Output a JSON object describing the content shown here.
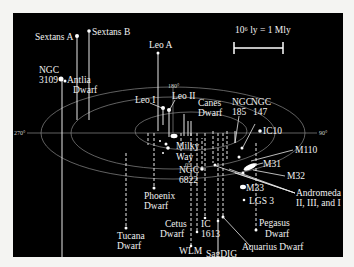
{
  "figure": {
    "scale_bar": {
      "label": "10⁶ ly = 1 Mly"
    },
    "axis_ticks": {
      "top": "180°",
      "left": "270°",
      "right": "90°",
      "bottom": "0°"
    }
  },
  "galaxies": {
    "sextans_a": "Sextans A",
    "sextans_b": "Sextans B",
    "ngc3109_l1": "NGC",
    "ngc3109_l2": "3109",
    "antlia_l1": "Antlia",
    "antlia_l2": "Dwarf",
    "leo_a": "Leo A",
    "leo_i": "Leo I",
    "leo_ii": "Leo II",
    "canes_l1": "Canes",
    "canes_l2": "Dwarf",
    "milky_l1": "Milky",
    "milky_l2": "Way",
    "ngc6822_l1": "NGC",
    "ngc6822_l2": "6822",
    "phoenix_l1": "Phoenix",
    "phoenix_l2": "Dwarf",
    "tucana_l1": "Tucana",
    "tucana_l2": "Dwarf",
    "ngc185_l1": "NGC",
    "ngc185_l2": "185",
    "ngc147_l1": "NGC",
    "ngc147_l2": "147",
    "ic10": "IC10",
    "m110": "M110",
    "m31": "M31",
    "m32": "M32",
    "m33": "M33",
    "andromeda_l1": "Andromeda",
    "andromeda_l2": "II, III, and I",
    "lgs3": "LGS 3",
    "pegasus_l1": "Pegasus",
    "pegasus_l2": "Dwarf",
    "aquarius": "Aquarius Dwarf",
    "cetus_l1": "Cetus",
    "cetus_l2": "Dwarf",
    "ic1613_l1": "IC",
    "ic1613_l2": "1613",
    "wlm": "WLM",
    "sagdig": "SagDIG"
  }
}
